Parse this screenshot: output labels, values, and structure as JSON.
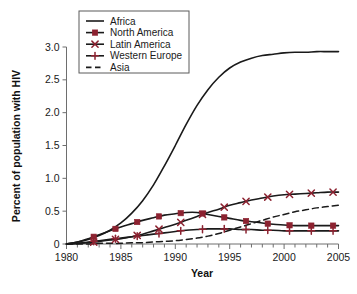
{
  "chart_data": {
    "type": "line",
    "title": "",
    "xlabel": "Year",
    "ylabel": "Percent of population with HIV",
    "xlim": [
      1980,
      2005
    ],
    "ylim": [
      0,
      3.0
    ],
    "grid": false,
    "legend_position": "top-left",
    "x_ticks": [
      1980,
      1985,
      1990,
      1995,
      2000,
      2005
    ],
    "x_tick_labels": [
      "1980",
      "1985",
      "1990",
      "1995",
      "2000",
      "2005"
    ],
    "x_minor_tick_step": 1,
    "y_ticks": [
      0,
      0.5,
      1.0,
      1.5,
      2.0,
      2.5,
      3.0
    ],
    "y_tick_labels": [
      "0",
      "0.5",
      "1.0",
      "1.5",
      "2.0",
      "2.5",
      "3.0"
    ],
    "x": [
      1980,
      1981,
      1982,
      1983,
      1984,
      1985,
      1986,
      1987,
      1988,
      1989,
      1990,
      1991,
      1992,
      1993,
      1994,
      1995,
      1996,
      1997,
      1998,
      1999,
      2000,
      2001,
      2002,
      2003,
      2004,
      2005
    ],
    "series": [
      {
        "name": "Africa",
        "color": "#1a1a1a",
        "marker": "none",
        "dash": "none",
        "values": [
          0.0,
          0.03,
          0.07,
          0.13,
          0.21,
          0.32,
          0.47,
          0.66,
          0.9,
          1.19,
          1.5,
          1.82,
          2.11,
          2.35,
          2.54,
          2.68,
          2.77,
          2.83,
          2.87,
          2.89,
          2.91,
          2.92,
          2.92,
          2.93,
          2.93,
          2.93
        ]
      },
      {
        "name": "North America",
        "color": "#8c2230",
        "marker": "square",
        "dash": "none",
        "marker_step": 2,
        "values": [
          0.0,
          0.03,
          0.08,
          0.14,
          0.2,
          0.26,
          0.31,
          0.36,
          0.4,
          0.44,
          0.46,
          0.48,
          0.48,
          0.45,
          0.42,
          0.39,
          0.36,
          0.34,
          0.32,
          0.3,
          0.29,
          0.28,
          0.28,
          0.28,
          0.28,
          0.28
        ]
      },
      {
        "name": "Latin America",
        "color": "#8c2230",
        "marker": "cross-x",
        "dash": "none",
        "marker_step": 2,
        "values": [
          0.0,
          0.01,
          0.02,
          0.04,
          0.06,
          0.08,
          0.11,
          0.15,
          0.2,
          0.25,
          0.3,
          0.36,
          0.42,
          0.48,
          0.53,
          0.59,
          0.63,
          0.67,
          0.7,
          0.73,
          0.75,
          0.76,
          0.77,
          0.78,
          0.79,
          0.79
        ]
      },
      {
        "name": "Western Europe",
        "color": "#8c2230",
        "marker": "plus",
        "dash": "none",
        "marker_step": 2,
        "values": [
          0.0,
          0.01,
          0.03,
          0.05,
          0.07,
          0.09,
          0.11,
          0.13,
          0.15,
          0.17,
          0.19,
          0.21,
          0.22,
          0.23,
          0.23,
          0.23,
          0.22,
          0.22,
          0.21,
          0.21,
          0.2,
          0.2,
          0.2,
          0.2,
          0.2,
          0.2
        ]
      },
      {
        "name": "Asia",
        "color": "#1a1a1a",
        "marker": "none",
        "dash": "dashed",
        "values": [
          0.0,
          0.0,
          0.0,
          0.01,
          0.01,
          0.01,
          0.02,
          0.02,
          0.03,
          0.04,
          0.05,
          0.07,
          0.09,
          0.12,
          0.16,
          0.21,
          0.26,
          0.31,
          0.36,
          0.41,
          0.45,
          0.49,
          0.52,
          0.55,
          0.57,
          0.59
        ]
      }
    ],
    "legend": [
      {
        "label": "Africa",
        "color": "#1a1a1a",
        "marker": "none",
        "dash": "none"
      },
      {
        "label": "North America",
        "color": "#8c2230",
        "marker": "square",
        "dash": "none"
      },
      {
        "label": "Latin America",
        "color": "#8c2230",
        "marker": "cross-x",
        "dash": "none"
      },
      {
        "label": "Western Europe",
        "color": "#8c2230",
        "marker": "plus",
        "dash": "none"
      },
      {
        "label": "Asia",
        "color": "#1a1a1a",
        "marker": "none",
        "dash": "dashed"
      }
    ]
  }
}
